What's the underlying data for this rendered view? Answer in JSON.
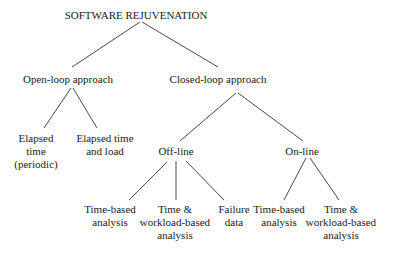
{
  "diagram": {
    "type": "tree",
    "root": {
      "label": "SOFTWARE REJUVENATION",
      "children": [
        {
          "label": "Open-loop approach",
          "children": [
            {
              "label": [
                "Elapsed",
                "time",
                "(periodic)"
              ]
            },
            {
              "label": [
                "Elapsed time",
                "and load"
              ]
            }
          ]
        },
        {
          "label": "Closed-loop approach",
          "children": [
            {
              "label": "Off-line",
              "children": [
                {
                  "label": [
                    "Time-based",
                    "analysis"
                  ]
                },
                {
                  "label": [
                    "Time &",
                    "workload-based",
                    "analysis"
                  ]
                },
                {
                  "label": [
                    "Failure",
                    "data"
                  ]
                }
              ]
            },
            {
              "label": "On-line",
              "children": [
                {
                  "label": [
                    "Time-based",
                    "analysis"
                  ]
                },
                {
                  "label": [
                    "Time &",
                    "workload-based",
                    "analysis"
                  ]
                }
              ]
            }
          ]
        }
      ]
    }
  },
  "nodes": {
    "root": "SOFTWARE REJUVENATION",
    "open_loop": "Open-loop approach",
    "closed_loop": "Closed-loop approach",
    "elapsed_periodic": {
      "l1": "Elapsed",
      "l2": "time",
      "l3": "(periodic)"
    },
    "elapsed_load": {
      "l1": "Elapsed time",
      "l2": "and load"
    },
    "offline": "Off-line",
    "online": "On-line",
    "off_time_based": {
      "l1": "Time-based",
      "l2": "analysis"
    },
    "off_time_workload": {
      "l1": "Time &",
      "l2": "workload-based",
      "l3": "analysis"
    },
    "off_failure": {
      "l1": "Failure",
      "l2": "data"
    },
    "on_time_based": {
      "l1": "Time-based",
      "l2": "analysis"
    },
    "on_time_workload": {
      "l1": "Time &",
      "l2": "workload-based",
      "l3": "analysis"
    }
  },
  "colors": {
    "line": "#333333",
    "text": "#1a1a1a",
    "background": "#ffffff"
  }
}
